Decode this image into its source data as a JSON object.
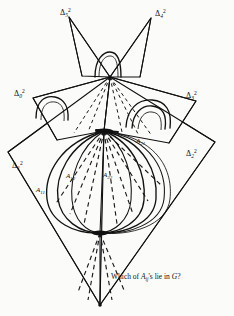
{
  "figure": {
    "caption": {
      "prefix": "Which of ",
      "symbol": "A",
      "subscript": "ij",
      "suffix": "'s lie in ",
      "group": "G",
      "question": "?",
      "full_text": "Which of Aij's lie in G?"
    },
    "stroke_color": "#111111",
    "background_color": "#fbfbfa",
    "dash_color": "#1a1a1a"
  },
  "simplices": [
    {
      "id": "d0",
      "symbol": "Δ",
      "sub": "0",
      "sup": "2",
      "x": 14,
      "y": 88
    },
    {
      "id": "d1",
      "symbol": "Δ",
      "sub": "1",
      "sup": "2",
      "x": 12,
      "y": 160
    },
    {
      "id": "d2",
      "symbol": "Δ",
      "sub": "2",
      "sup": "2",
      "x": 186,
      "y": 148
    },
    {
      "id": "d3",
      "symbol": "Δ",
      "sub": "3",
      "sup": "2",
      "x": 186,
      "y": 90
    },
    {
      "id": "d4",
      "symbol": "Δ",
      "sub": "4",
      "sup": "2",
      "x": 155,
      "y": 8
    },
    {
      "id": "d5",
      "symbol": "Δ",
      "sub": "5",
      "sup": "2",
      "x": 60,
      "y": 7
    }
  ],
  "arcs": [
    {
      "id": "a11",
      "symbol": "A",
      "sub": "11",
      "x": 36,
      "y": 186
    },
    {
      "id": "a12",
      "symbol": "A",
      "sub": "12",
      "x": 66,
      "y": 172
    },
    {
      "id": "a21",
      "symbol": "A",
      "sub": "21",
      "x": 136,
      "y": 137
    },
    {
      "id": "a22",
      "symbol": "A",
      "sub": "22",
      "x": 103,
      "y": 171
    }
  ],
  "vertices": [
    {
      "id": "top",
      "x": 110,
      "y": 77,
      "label": "apex"
    },
    {
      "id": "middle",
      "x": 104,
      "y": 131,
      "label": "upper-node"
    },
    {
      "id": "lower",
      "x": 100,
      "y": 233,
      "label": "lower-node"
    },
    {
      "id": "bottom",
      "x": 100,
      "y": 305,
      "label": "base"
    }
  ]
}
